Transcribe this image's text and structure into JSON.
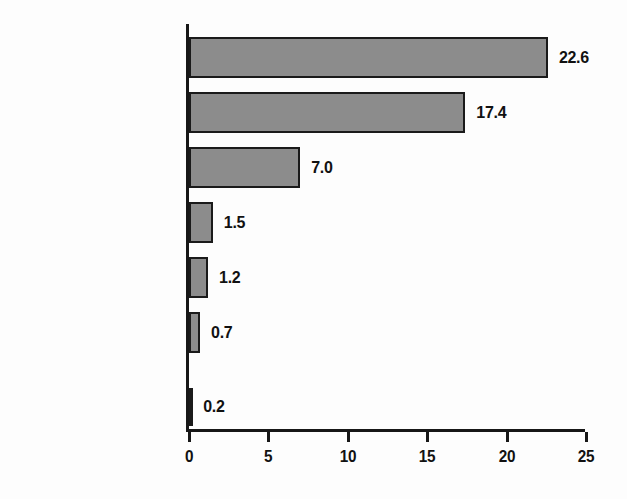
{
  "chart_data": {
    "type": "bar",
    "orientation": "horizontal",
    "title": "",
    "xlabel": "",
    "ylabel": "",
    "categories": [
      "Illicit Drugs",
      "Marijuana",
      "Psychotherapeutics",
      "Cocaine",
      "Hallucinogens",
      "Inhalants",
      "Heroin"
    ],
    "values": [
      22.6,
      17.4,
      7.0,
      1.5,
      1.2,
      0.7,
      0.2
    ],
    "value_labels": [
      "22.6",
      "17.4",
      "7.0",
      "1.5",
      "1.2",
      "0.7",
      "0.2"
    ],
    "xlim": [
      0,
      25
    ],
    "xticks": [
      0,
      5,
      10,
      15,
      20,
      25
    ],
    "xtick_labels": [
      "0",
      "5",
      "10",
      "15",
      "20",
      "25"
    ],
    "grid": false,
    "legend": null,
    "bar_fill_color": "#8c8c8c",
    "bar_edge_color": "#1a1a1a",
    "axis_color": "#171717",
    "text_color": "#111111",
    "background_color": "#fdfdfd"
  }
}
